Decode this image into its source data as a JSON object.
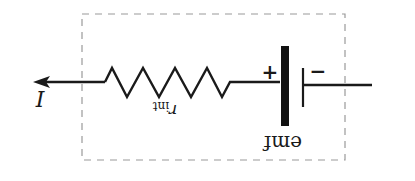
{
  "diagram": {
    "type": "circuit-schematic",
    "orientation": "rotated-180",
    "colors": {
      "stroke": "#1a1a1a",
      "dashed_box": "#9a9a9a",
      "background": "#ffffff"
    },
    "labels": {
      "current": "I",
      "internal_resistance_base": "r",
      "internal_resistance_sub": "int",
      "emf": "emf",
      "positive_terminal": "+",
      "negative_terminal": "−"
    },
    "components": [
      {
        "name": "current-arrow",
        "label": "I",
        "direction": "left"
      },
      {
        "name": "internal-resistor",
        "label": "r_int"
      },
      {
        "name": "battery-cell",
        "label": "emf",
        "terminals": [
          "+",
          "−"
        ]
      }
    ],
    "enclosure": "dashed-rectangle"
  }
}
